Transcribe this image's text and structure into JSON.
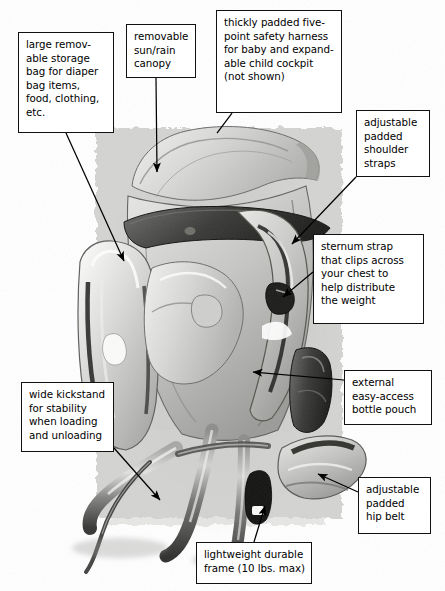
{
  "figure": {
    "width": 445,
    "height": 591,
    "background_color": "#ffffff",
    "box_border_color": "#111111",
    "leader_line_color": "#000000"
  },
  "callouts": [
    {
      "id": "storage-bag",
      "text": "large remov-\nable storage\nbag for diaper\nbag items,\nfood, clothing,\netc."
    },
    {
      "id": "canopy",
      "text": "removable\nsun/rain\ncanopy"
    },
    {
      "id": "harness",
      "text": "thickly padded five-\npoint safety harness\nfor baby and expand-\nable child cockpit\n(not shown)"
    },
    {
      "id": "shoulder-straps",
      "text": "adjustable\npadded\nshoulder\nstraps"
    },
    {
      "id": "sternum-strap",
      "text": "sternum strap\nthat clips across\nyour chest to\nhelp distribute\nthe weight"
    },
    {
      "id": "kickstand",
      "text": "wide kickstand\nfor stability\nwhen loading\nand unloading"
    },
    {
      "id": "bottle-pouch",
      "text": "external\neasy-access\nbottle pouch"
    },
    {
      "id": "hip-belt",
      "text": "adjustable\npadded\nhip belt"
    },
    {
      "id": "frame",
      "text": "lightweight durable\nframe (10 lbs. max)"
    }
  ]
}
